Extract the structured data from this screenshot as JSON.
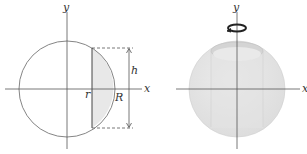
{
  "left_figure": {
    "axis_x_label": "x",
    "axis_y_label": "y",
    "inner_radius_label": "r",
    "outer_radius_label": "R",
    "height_label": "h"
  },
  "right_figure": {
    "axis_x_label": "x",
    "axis_y_label": "y",
    "rotation_icon": "rotation-arrow-icon"
  },
  "colors": {
    "line": "#666666",
    "shade": "#e6e6e6",
    "sphere": "#e4e4e4"
  }
}
